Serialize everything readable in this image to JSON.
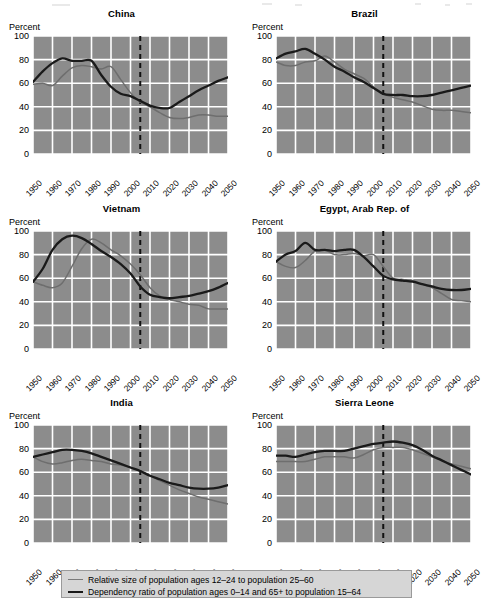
{
  "figure": {
    "y_axis_label": "Percent",
    "yticks": [
      0,
      20,
      40,
      60,
      80,
      100
    ],
    "xticks": [
      1950,
      1960,
      1970,
      1980,
      1990,
      2000,
      2010,
      2020,
      2030,
      2040,
      2050
    ],
    "ylim": [
      0,
      100
    ],
    "xlim": [
      1950,
      2050
    ],
    "reference_line_year": 2005,
    "colors": {
      "plot_background": "#8c8c8c",
      "gridlines": "#ffffff",
      "series_light": "#6e6e6e",
      "series_dark": "#1a1a1a",
      "reference_line": "#111111",
      "legend_background": "#d6d6d6",
      "legend_border": "#9a9a9a",
      "page_background": "#ffffff"
    }
  },
  "legend": {
    "items": [
      {
        "key": "relative-size",
        "label": "Relative size of population ages 12–24 to population 25–60",
        "style": "light"
      },
      {
        "key": "dependency-ratio",
        "label": "Dependency ratio of population ages 0–14 and 65+ to population 15–64",
        "style": "dark"
      }
    ]
  },
  "chart_data": [
    {
      "id": "china",
      "type": "line",
      "title": "China",
      "xlabel": "",
      "ylabel": "Percent",
      "ylim": [
        0,
        100
      ],
      "xlim": [
        1950,
        2050
      ],
      "grid": true,
      "x": [
        1950,
        1955,
        1960,
        1965,
        1970,
        1975,
        1980,
        1985,
        1990,
        1995,
        2000,
        2005,
        2010,
        2015,
        2020,
        2025,
        2030,
        2035,
        2040,
        2045,
        2050
      ],
      "series": [
        {
          "name": "Relative size of population ages 12–24 to population 25–60",
          "style": "light",
          "values": [
            59,
            60,
            58,
            66,
            73,
            75,
            74,
            72,
            74,
            63,
            52,
            44,
            40,
            35,
            31,
            30,
            31,
            33,
            33,
            32,
            32
          ]
        },
        {
          "name": "Dependency ratio of population ages 0–14 and 65+ to population 15–64",
          "style": "dark",
          "values": [
            61,
            70,
            77,
            81,
            79,
            79,
            79,
            67,
            57,
            51,
            49,
            45,
            41,
            39,
            39,
            44,
            49,
            54,
            58,
            62,
            65
          ]
        }
      ],
      "annotations": [
        {
          "type": "vline",
          "x": 2005,
          "style": "dashed"
        }
      ]
    },
    {
      "id": "brazil",
      "type": "line",
      "title": "Brazil",
      "xlabel": "",
      "ylabel": "Percent",
      "ylim": [
        0,
        100
      ],
      "xlim": [
        1950,
        2050
      ],
      "grid": true,
      "x": [
        1950,
        1955,
        1960,
        1965,
        1970,
        1975,
        1980,
        1985,
        1990,
        1995,
        2000,
        2005,
        2010,
        2015,
        2020,
        2025,
        2030,
        2035,
        2040,
        2045,
        2050
      ],
      "series": [
        {
          "name": "Relative size of population ages 12–24 to population 25–60",
          "style": "light",
          "values": [
            78,
            75,
            75,
            78,
            79,
            83,
            78,
            72,
            68,
            64,
            57,
            51,
            48,
            46,
            44,
            41,
            38,
            37,
            37,
            36,
            35
          ]
        },
        {
          "name": "Dependency ratio of population ages 0–14 and 65+ to population 15–64",
          "style": "dark",
          "values": [
            81,
            85,
            87,
            89,
            85,
            80,
            74,
            70,
            65,
            61,
            56,
            51,
            50,
            50,
            49,
            49,
            50,
            52,
            54,
            56,
            58
          ]
        }
      ],
      "annotations": [
        {
          "type": "vline",
          "x": 2005,
          "style": "dashed"
        }
      ]
    },
    {
      "id": "vietnam",
      "type": "line",
      "title": "Vietnam",
      "xlabel": "",
      "ylabel": "Percent",
      "ylim": [
        0,
        100
      ],
      "xlim": [
        1950,
        2050
      ],
      "grid": true,
      "x": [
        1950,
        1955,
        1960,
        1965,
        1970,
        1975,
        1980,
        1985,
        1990,
        1995,
        2000,
        2005,
        2010,
        2015,
        2020,
        2025,
        2030,
        2035,
        2040,
        2045,
        2050
      ],
      "series": [
        {
          "name": "Relative size of population ages 12–24 to population 25–60",
          "style": "light",
          "values": [
            57,
            54,
            52,
            56,
            70,
            85,
            93,
            90,
            84,
            79,
            72,
            63,
            52,
            45,
            42,
            40,
            38,
            37,
            34,
            34,
            34
          ]
        },
        {
          "name": "Dependency ratio of population ages 0–14 and 65+ to population 15–64",
          "style": "dark",
          "values": [
            57,
            68,
            84,
            93,
            96,
            94,
            89,
            83,
            78,
            72,
            64,
            53,
            46,
            44,
            43,
            44,
            45,
            47,
            49,
            52,
            56
          ]
        }
      ],
      "annotations": [
        {
          "type": "vline",
          "x": 2005,
          "style": "dashed"
        }
      ]
    },
    {
      "id": "egypt",
      "type": "line",
      "title": "Egypt, Arab Rep. of",
      "xlabel": "",
      "ylabel": "Percent",
      "ylim": [
        0,
        100
      ],
      "xlim": [
        1950,
        2050
      ],
      "grid": true,
      "x": [
        1950,
        1955,
        1960,
        1965,
        1970,
        1975,
        1980,
        1985,
        1990,
        1995,
        2000,
        2005,
        2010,
        2015,
        2020,
        2025,
        2030,
        2035,
        2040,
        2045,
        2050
      ],
      "series": [
        {
          "name": "Relative size of population ages 12–24 to population 25–60",
          "style": "light",
          "values": [
            74,
            70,
            69,
            75,
            83,
            84,
            80,
            80,
            81,
            79,
            80,
            70,
            60,
            59,
            58,
            55,
            52,
            47,
            42,
            41,
            40
          ]
        },
        {
          "name": "Dependency ratio of population ages 0–14 and 65+ to population 15–64",
          "style": "dark",
          "values": [
            74,
            80,
            83,
            90,
            84,
            84,
            83,
            84,
            84,
            78,
            70,
            62,
            59,
            58,
            57,
            55,
            53,
            51,
            50,
            50,
            51
          ]
        }
      ],
      "annotations": [
        {
          "type": "vline",
          "x": 2005,
          "style": "dashed"
        }
      ]
    },
    {
      "id": "india",
      "type": "line",
      "title": "India",
      "xlabel": "",
      "ylabel": "Percent",
      "ylim": [
        0,
        100
      ],
      "xlim": [
        1950,
        2050
      ],
      "grid": true,
      "x": [
        1950,
        1955,
        1960,
        1965,
        1970,
        1975,
        1980,
        1985,
        1990,
        1995,
        2000,
        2005,
        2010,
        2015,
        2020,
        2025,
        2030,
        2035,
        2040,
        2045,
        2050
      ],
      "series": [
        {
          "name": "Relative size of population ages 12–24 to population 25–60",
          "style": "light",
          "values": [
            73,
            69,
            67,
            68,
            70,
            71,
            70,
            69,
            67,
            66,
            64,
            61,
            57,
            53,
            49,
            45,
            42,
            39,
            37,
            35,
            33
          ]
        },
        {
          "name": "Dependency ratio of population ages 0–14 and 65+ to population 15–64",
          "style": "dark",
          "values": [
            73,
            75,
            77,
            79,
            79,
            78,
            76,
            73,
            70,
            67,
            64,
            61,
            57,
            54,
            51,
            49,
            47,
            46,
            46,
            47,
            49
          ]
        }
      ],
      "annotations": [
        {
          "type": "vline",
          "x": 2005,
          "style": "dashed"
        }
      ]
    },
    {
      "id": "sierra-leone",
      "type": "line",
      "title": "Sierra Leone",
      "xlabel": "",
      "ylabel": "Percent",
      "ylim": [
        0,
        100
      ],
      "xlim": [
        1950,
        2050
      ],
      "grid": true,
      "x": [
        1950,
        1955,
        1960,
        1965,
        1970,
        1975,
        1980,
        1985,
        1990,
        1995,
        2000,
        2005,
        2010,
        2015,
        2020,
        2025,
        2030,
        2035,
        2040,
        2045,
        2050
      ],
      "series": [
        {
          "name": "Relative size of population ages 12–24 to population 25–60",
          "style": "light",
          "values": [
            69,
            69,
            69,
            69,
            71,
            73,
            73,
            73,
            72,
            75,
            79,
            81,
            81,
            81,
            79,
            76,
            73,
            70,
            67,
            65,
            63
          ]
        },
        {
          "name": "Dependency ratio of population ages 0–14 and 65+ to population 15–64",
          "style": "dark",
          "values": [
            74,
            74,
            73,
            75,
            77,
            78,
            78,
            78,
            80,
            82,
            84,
            85,
            86,
            85,
            83,
            79,
            74,
            70,
            66,
            62,
            58
          ]
        }
      ],
      "annotations": [
        {
          "type": "vline",
          "x": 2005,
          "style": "dashed"
        }
      ]
    }
  ]
}
